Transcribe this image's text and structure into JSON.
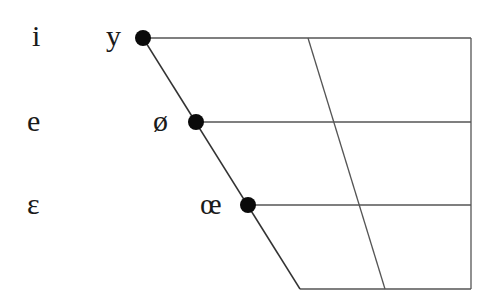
{
  "diagram": {
    "type": "vowel-quadrilateral",
    "colors": {
      "lines": "#555555",
      "dots": "#0a0a0a",
      "text": "#1a1a1a",
      "background": "#ffffff"
    },
    "unrounded_reference_labels": [
      {
        "symbol": "i",
        "row": "close"
      },
      {
        "symbol": "e",
        "row": "close-mid"
      },
      {
        "symbol": "ɛ",
        "row": "open-mid"
      }
    ],
    "rounded_vowels": [
      {
        "symbol": "y",
        "row": "close",
        "dot": true
      },
      {
        "symbol": "ø",
        "row": "close-mid",
        "dot": true
      },
      {
        "symbol": "œ",
        "row": "open-mid",
        "dot": true
      }
    ],
    "rows": [
      "close",
      "close-mid",
      "open-mid",
      "open"
    ]
  },
  "labels": {
    "i": "i",
    "e": "e",
    "epsilon": "ɛ",
    "y": "y",
    "o_slash": "ø",
    "oe": "œ"
  }
}
